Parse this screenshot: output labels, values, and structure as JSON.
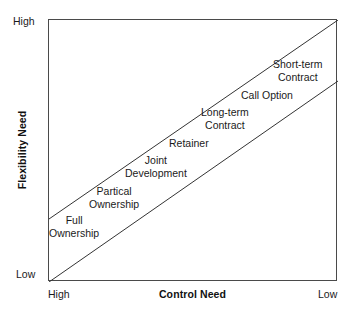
{
  "figure": {
    "type": "diagram",
    "background": "#ffffff",
    "frame_color": "#4a4a4a",
    "line_color": "#333333"
  },
  "axes": {
    "y": {
      "title": "Flexibility Need",
      "tick_high": "High",
      "tick_low": "Low"
    },
    "x": {
      "title": "Control Need",
      "tick_high": "High",
      "tick_low": "Low"
    }
  },
  "chart_data": {
    "type": "scatter",
    "title": "",
    "xlabel": "Control Need",
    "ylabel": "Flexibility Need",
    "xlim": [
      "High",
      "Low"
    ],
    "ylim": [
      "Low",
      "High"
    ],
    "grid": false,
    "legend": "none",
    "annotations": [
      {
        "label": "Full Ownership",
        "lines": [
          "Full",
          "Ownership"
        ]
      },
      {
        "label": "Partical Ownership",
        "lines": [
          "Partical",
          "Ownership"
        ]
      },
      {
        "label": "Joint Development",
        "lines": [
          "Joint",
          "Development"
        ]
      },
      {
        "label": "Retainer",
        "lines": [
          "Retainer"
        ]
      },
      {
        "label": "Long-term Contract",
        "lines": [
          "Long-term",
          "Contract"
        ]
      },
      {
        "label": "Call Option",
        "lines": [
          "Call Option"
        ]
      },
      {
        "label": "Short-term Contract",
        "lines": [
          "Short-term",
          "Contract"
        ]
      }
    ],
    "bands": [
      {
        "name": "upper-boundary",
        "from": [
          0,
          199
        ],
        "to": [
          289,
          0
        ]
      },
      {
        "name": "lower-boundary",
        "from": [
          0,
          262
        ],
        "to": [
          289,
          61
        ]
      }
    ]
  },
  "options": [
    {
      "id": "full-ownership",
      "line1": "Full",
      "line2": "Ownership",
      "left": 48,
      "top": 213
    },
    {
      "id": "partical-ownership",
      "line1": "Partical",
      "line2": "Ownership",
      "left": 88,
      "top": 184
    },
    {
      "id": "joint-development",
      "line1": "Joint",
      "line2": "Development",
      "left": 124,
      "top": 153
    },
    {
      "id": "retainer",
      "line1": "Retainer",
      "line2": "",
      "left": 168,
      "top": 136
    },
    {
      "id": "long-term-contract",
      "line1": "Long-term",
      "line2": "Contract",
      "left": 200,
      "top": 105
    },
    {
      "id": "call-option",
      "line1": "Call Option",
      "line2": "",
      "left": 240,
      "top": 88
    },
    {
      "id": "short-term-contract",
      "line1": "Short-term",
      "line2": "Contract",
      "left": 272,
      "top": 57
    }
  ]
}
